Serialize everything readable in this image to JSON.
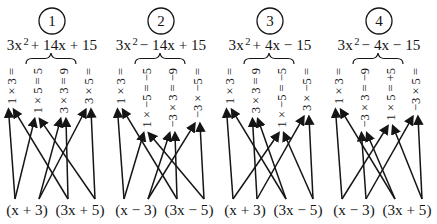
{
  "colors": {
    "ink": "#151515",
    "background": "#ffffff"
  },
  "panels": [
    {
      "number": "1",
      "expr_lead": "3x",
      "expr_sup": "2",
      "expr_rest": "+ 14x + 15",
      "products": [
        "1 × 3 =",
        "1 × 5 = 5",
        "3 × 3 = 9",
        "3 × 5 ="
      ],
      "factors": [
        "(x + 3)",
        "(3x + 5)"
      ]
    },
    {
      "number": "2",
      "expr_lead": "3x",
      "expr_sup": "2",
      "expr_rest": "− 14x + 15",
      "products": [
        "1 × 3 =",
        "1 × −5 = −5",
        "−3 × 3 = −9",
        "−3 × −5 ="
      ],
      "factors": [
        "(x − 3)",
        "(3x − 5)"
      ]
    },
    {
      "number": "3",
      "expr_lead": "3x",
      "expr_sup": "2",
      "expr_rest": "+ 4x − 15",
      "products": [
        "1 × 3 =",
        "3 × 3 = 9",
        "1 × −5 = −5",
        "3 × −5 ="
      ],
      "factors": [
        "(x + 3)",
        "(3x − 5)"
      ]
    },
    {
      "number": "4",
      "expr_lead": "3x",
      "expr_sup": "2",
      "expr_rest": "− 4x − 15",
      "products": [
        "1 × 3 =",
        "−3 × 3 = −9",
        "1 × 5 = +5",
        "−3 × 5 ="
      ],
      "factors": [
        "(x − 3)",
        "(3x + 5)"
      ]
    }
  ]
}
